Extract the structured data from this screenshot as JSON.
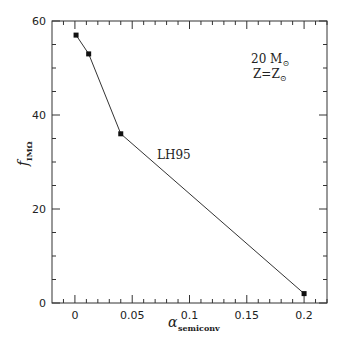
{
  "chart_data": {
    "type": "line",
    "title": "",
    "xlabel": "α_semiconv",
    "xlabel_symbol": "α",
    "xlabel_sub": "semiconv",
    "ylabel": "f_IMΩ",
    "ylabel_symbol": "f",
    "ylabel_sub": "IMΩ",
    "xlim": [
      -0.02,
      0.22
    ],
    "ylim": [
      0,
      60
    ],
    "x_ticks": [
      0,
      0.05,
      0.1,
      0.15,
      0.2
    ],
    "x_tick_labels": [
      "0",
      "0.05",
      "0.1",
      "0.15",
      "0.2"
    ],
    "y_ticks": [
      0,
      20,
      40,
      60
    ],
    "y_tick_labels": [
      "0",
      "20",
      "40",
      "60"
    ],
    "grid": false,
    "legend": null,
    "series": [
      {
        "name": "LH95",
        "marker": "square",
        "x": [
          0.001,
          0.012,
          0.04,
          0.2
        ],
        "y": [
          57,
          53,
          36,
          2
        ]
      }
    ],
    "annotations": [
      {
        "text": "LH95",
        "x": 0.09,
        "y": 30
      },
      {
        "text": "20 M⊙",
        "x": 0.185,
        "y": 54
      },
      {
        "text": "Z=Z⊙",
        "x": 0.185,
        "y": 50
      }
    ]
  },
  "labels": {
    "line_label": "LH95",
    "mass_label": "20 M",
    "metal_label": "Z=Z",
    "sun_symbol": "⊙",
    "x_symbol": "α",
    "x_sub": "semiconv",
    "y_symbol": "f",
    "y_sub": "IMΩ"
  }
}
